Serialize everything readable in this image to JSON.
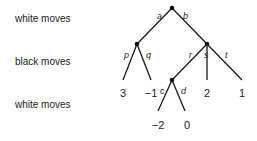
{
  "row_labels": [
    "white moves",
    "black moves",
    "white moves"
  ],
  "edges": {
    "a": "a",
    "b": "b",
    "p": "p",
    "q": "q",
    "r": "r",
    "s": "s",
    "t": "t",
    "c": "c",
    "d": "d"
  },
  "leaves": {
    "p": "3",
    "q": "−1",
    "s": "2",
    "t": "1",
    "c": "−2",
    "d": "0"
  }
}
